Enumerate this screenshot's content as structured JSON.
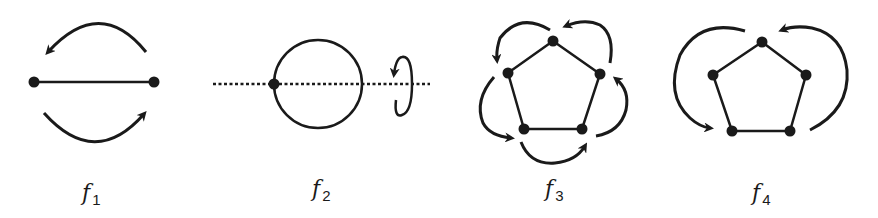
{
  "figure": {
    "panels": [
      {
        "id": "f1",
        "label": "f",
        "subscript": "1",
        "description": "Line segment with two vertices; curved arrows above and below indicating swap of endpoints"
      },
      {
        "id": "f2",
        "label": "f",
        "subscript": "2",
        "description": "Circle with one marked vertex on a dotted axis; rotation arrow around the axis"
      },
      {
        "id": "f3",
        "label": "f",
        "subscript": "3",
        "description": "Pentagon with five curved arrows indicating rotation of vertices"
      },
      {
        "id": "f4",
        "label": "f",
        "subscript": "4",
        "description": "Pentagon with two large curved arrows indicating reflection"
      }
    ],
    "colors": {
      "stroke": "#1a1a1a",
      "background": "#ffffff"
    }
  }
}
